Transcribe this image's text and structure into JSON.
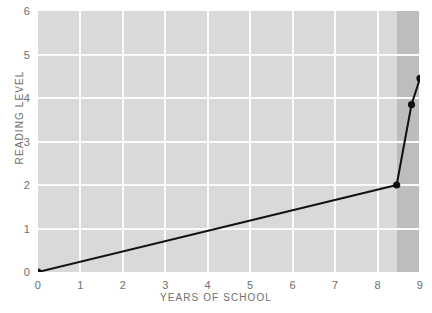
{
  "chart_data": {
    "type": "line",
    "title": "",
    "xlabel": "YEARS OF SCHOOL",
    "ylabel": "READING LEVEL",
    "xlim": [
      0,
      9
    ],
    "ylim": [
      0,
      6
    ],
    "xticks": [
      "0",
      "1",
      "2",
      "3",
      "4",
      "5",
      "6",
      "7",
      "8",
      "9"
    ],
    "yticks": [
      "0",
      "1",
      "2",
      "3",
      "4",
      "5",
      "6"
    ],
    "grid": true,
    "legend": "none",
    "series": [
      {
        "name": "reading level",
        "x": [
          0,
          8.45,
          8.8,
          9
        ],
        "y": [
          0,
          2.0,
          3.85,
          4.45
        ],
        "marker": "circle",
        "color": "#111111",
        "linewidth": 2
      }
    ],
    "annotations": [
      {
        "kind": "shaded-band",
        "x_start": 8.45,
        "x_end": 9,
        "color": "#bdbdbd"
      }
    ],
    "colors": {
      "plot_background": "#d9d9d9",
      "gridline": "#fbfbfb",
      "band": "#bdbdbd",
      "line": "#111111",
      "text": "#6e6e6e",
      "page_background": "#ffffff"
    }
  }
}
